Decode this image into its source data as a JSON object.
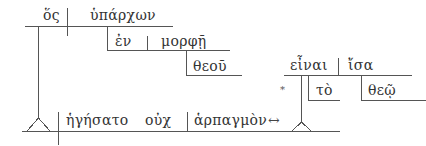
{
  "diagram": {
    "type": "sentence-diagram",
    "language": "Greek (Koine)",
    "line_color": "#555555",
    "text_color": "#333333",
    "words": {
      "subject": "ὅς",
      "participle": "ὑπάρχων",
      "preposition": "ἐν",
      "prep_object": "μορφῇ",
      "genitive": "θεοῦ",
      "main_verb": "ἡγήσατο",
      "negation": "οὐχ",
      "object": "ἁρπαγμὸν",
      "infinitive": "εἶναι",
      "predicate": "ἴσα",
      "article": "τὸ",
      "dative": "θεῷ"
    },
    "marks": {
      "asterisk": "*",
      "double_arrow": "↔"
    }
  }
}
